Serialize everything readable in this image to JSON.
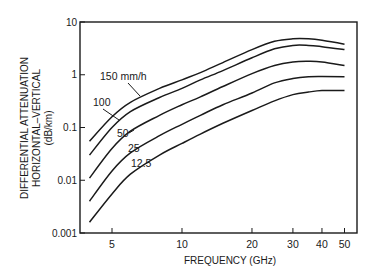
{
  "chart_data": {
    "type": "line",
    "title": "",
    "xlabel": "FREQUENCY (GHz)",
    "ylabel_lines": [
      "DIFFERENTIAL ATTENUATION",
      "HORIZONTAL–VERTICAL",
      "(dB/km)"
    ],
    "x_scale": "log",
    "y_scale": "log",
    "xlim": [
      3.5,
      57
    ],
    "ylim": [
      0.001,
      10
    ],
    "x_ticks": [
      5,
      10,
      20,
      30,
      40,
      50
    ],
    "x_tick_labels": [
      "5",
      "10",
      "20",
      "30",
      "40",
      "50"
    ],
    "y_ticks": [
      0.001,
      0.01,
      0.1,
      1,
      10
    ],
    "y_tick_labels": [
      "0.001",
      "0.01",
      "0.1",
      "1",
      "10"
    ],
    "grid": false,
    "legend": "inline labels",
    "x": [
      4,
      5,
      6,
      8,
      10,
      12,
      15,
      20,
      25,
      30,
      35,
      40,
      50
    ],
    "series": [
      {
        "name": "150 mm/h",
        "label": "150 mm/h",
        "values": [
          0.055,
          0.16,
          0.3,
          0.55,
          0.8,
          1.1,
          1.7,
          3.0,
          4.3,
          4.8,
          4.8,
          4.5,
          3.8
        ]
      },
      {
        "name": "100 mm/h",
        "label": "100",
        "values": [
          0.03,
          0.1,
          0.2,
          0.37,
          0.55,
          0.8,
          1.2,
          2.1,
          3.1,
          3.6,
          3.6,
          3.4,
          3.0
        ]
      },
      {
        "name": "50 mm/h",
        "label": "50",
        "values": [
          0.011,
          0.04,
          0.085,
          0.17,
          0.27,
          0.38,
          0.6,
          1.05,
          1.5,
          1.75,
          1.8,
          1.75,
          1.5
        ]
      },
      {
        "name": "25 mm/h",
        "label": "25",
        "values": [
          0.004,
          0.015,
          0.033,
          0.07,
          0.115,
          0.17,
          0.27,
          0.45,
          0.7,
          0.85,
          0.92,
          0.93,
          0.92
        ]
      },
      {
        "name": "12.5 mm/h",
        "label": "12.5",
        "values": [
          0.0016,
          0.0055,
          0.013,
          0.03,
          0.05,
          0.075,
          0.12,
          0.21,
          0.32,
          0.42,
          0.47,
          0.5,
          0.5
        ]
      }
    ]
  }
}
